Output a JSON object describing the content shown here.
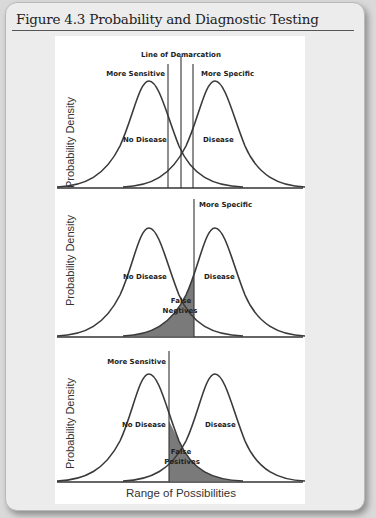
{
  "figure": {
    "title": "Figure 4.3 Probability and Diagnostic Testing",
    "x_axis_label": "Range of Possibilities",
    "panels": [
      {
        "y_axis_label": "Probability Density",
        "top_label": "Line of Demarcation",
        "left_line_label": "More Sensitive",
        "right_line_label": "More Specific",
        "left_curve_label": "No Disease",
        "right_curve_label": "Disease"
      },
      {
        "y_axis_label": "Probability Density",
        "line_label": "More Specific",
        "left_curve_label": "No Disease",
        "right_curve_label": "Disease",
        "shaded_label_line1": "False",
        "shaded_label_line2": "Negtives"
      },
      {
        "y_axis_label": "Probability Density",
        "line_label": "More Sensitive",
        "left_curve_label": "No Disease",
        "right_curve_label": "Disease",
        "shaded_label_line1": "False",
        "shaded_label_line2": "Positives"
      }
    ],
    "colors": {
      "card_bg": "#ececec",
      "curve": "#3a3a3a",
      "shade": "#7a7a7a"
    }
  }
}
